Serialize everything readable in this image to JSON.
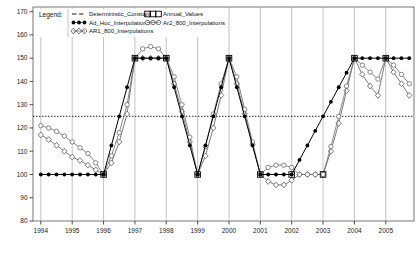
{
  "chart_data": {
    "type": "line",
    "title": "",
    "xlabel": "",
    "ylabel": "",
    "xlim": [
      1993.75,
      2005.9
    ],
    "ylim": [
      80,
      172
    ],
    "grid": true,
    "y_ticks": [
      80,
      90,
      100,
      110,
      120,
      130,
      140,
      150,
      160,
      170
    ],
    "x_ticks": [
      1994,
      1995,
      1996,
      1997,
      1998,
      1999,
      2000,
      2001,
      2002,
      2003,
      2004,
      2005
    ],
    "reference_line": {
      "name": "Deterministic_Constant",
      "value": 125,
      "style": "dotted"
    },
    "legend": {
      "position": "top-left-inside",
      "title": "Legend:",
      "entries": [
        {
          "label": "Deterministic_Constant",
          "marker": "none",
          "line": "dashed",
          "color": "#000000"
        },
        {
          "label": "Ad_Hoc_Interpolations",
          "marker": "filled-circle",
          "line": "solid",
          "color": "#000000"
        },
        {
          "label": "AR1_800_Interpolations",
          "marker": "open-diamond",
          "line": "solid",
          "color": "#4d4d4d"
        },
        {
          "label": "Annual_Values",
          "marker": "open-square",
          "line": "none",
          "color": "#000000"
        },
        {
          "label": "Ar2_800_Interpolations",
          "marker": "open-circle",
          "line": "solid",
          "color": "#4d4d4d"
        }
      ]
    },
    "series": [
      {
        "name": "Ad_Hoc_Interpolations",
        "marker": "filled-circle",
        "x": [
          1994.0,
          1994.25,
          1994.5,
          1994.75,
          1995.0,
          1995.25,
          1995.5,
          1995.75,
          1996.0,
          1996.25,
          1996.5,
          1996.75,
          1997.0,
          1997.25,
          1997.5,
          1997.75,
          1998.0,
          1998.25,
          1998.5,
          1998.75,
          1999.0,
          1999.25,
          1999.5,
          1999.75,
          2000.0,
          2000.25,
          2000.5,
          2000.75,
          2001.0,
          2001.25,
          2001.5,
          2001.75,
          2002.0,
          2002.25,
          2002.5,
          2002.75,
          2003.0,
          2003.25,
          2003.5,
          2003.75,
          2004.0,
          2004.25,
          2004.5,
          2004.75,
          2005.0,
          2005.25,
          2005.5,
          2005.75
        ],
        "y": [
          100,
          100,
          100,
          100,
          100,
          100,
          100,
          100,
          100,
          112.5,
          125,
          137.5,
          150,
          150,
          150,
          150,
          150,
          137.5,
          125,
          112.5,
          100,
          112.5,
          125,
          137.5,
          150,
          137.5,
          125,
          112.5,
          100,
          100,
          100,
          100,
          100,
          106.25,
          112.5,
          118.75,
          125,
          131.25,
          137.5,
          143.75,
          150,
          150,
          150,
          150,
          150,
          150,
          150,
          150
        ]
      },
      {
        "name": "AR1_800_Interpolations",
        "marker": "open-diamond",
        "x": [
          1994.0,
          1994.25,
          1994.5,
          1994.75,
          1995.0,
          1995.25,
          1995.5,
          1995.75,
          1996.0,
          1996.25,
          1996.5,
          1996.75,
          1997.0,
          1997.25,
          1997.5,
          1997.75,
          1998.0,
          1998.25,
          1998.5,
          1998.75,
          1999.0,
          1999.25,
          1999.5,
          1999.75,
          2000.0,
          2000.25,
          2000.5,
          2000.75,
          2001.0,
          2001.25,
          2001.5,
          2001.75,
          2002.0,
          2002.25,
          2002.5,
          2002.75,
          2003.0,
          2003.25,
          2003.5,
          2003.75,
          2004.0,
          2004.25,
          2004.5,
          2004.75,
          2005.0,
          2005.25,
          2005.5,
          2005.75
        ],
        "y": [
          117,
          115,
          112.5,
          110,
          107.5,
          106,
          104,
          102,
          100,
          105,
          114,
          126,
          150,
          150,
          150,
          150,
          150,
          139,
          127,
          114,
          100,
          108,
          120,
          134,
          150,
          139,
          126,
          113,
          100,
          97,
          95.5,
          95.5,
          97.5,
          100,
          100,
          100,
          100,
          110,
          122,
          136,
          150,
          143,
          138,
          134,
          150,
          144,
          139,
          134
        ]
      },
      {
        "name": "Ar2_800_Interpolations",
        "marker": "open-circle",
        "x": [
          1994.0,
          1994.25,
          1994.5,
          1994.75,
          1995.0,
          1995.25,
          1995.5,
          1995.75,
          1996.0,
          1996.25,
          1996.5,
          1996.75,
          1997.0,
          1997.25,
          1997.5,
          1997.75,
          1998.0,
          1998.25,
          1998.5,
          1998.75,
          1999.0,
          1999.25,
          1999.5,
          1999.75,
          2000.0,
          2000.25,
          2000.5,
          2000.75,
          2001.0,
          2001.25,
          2001.5,
          2001.75,
          2002.0,
          2002.25,
          2002.5,
          2002.75,
          2003.0,
          2003.25,
          2003.5,
          2003.75,
          2004.0,
          2004.25,
          2004.5,
          2004.75,
          2005.0,
          2005.25,
          2005.5,
          2005.75
        ],
        "y": [
          121,
          120,
          118.5,
          116.5,
          114,
          111.5,
          109,
          105,
          100,
          108,
          118,
          130,
          150,
          154,
          155,
          154,
          150,
          142,
          130,
          116,
          100,
          112,
          126,
          139,
          150,
          142,
          128,
          114,
          100,
          103,
          104,
          104,
          103,
          100,
          100,
          100,
          100,
          112,
          125,
          138,
          150,
          147,
          144,
          141,
          150,
          147,
          143,
          139
        ]
      },
      {
        "name": "Annual_Values",
        "marker": "open-square",
        "line": "none",
        "x": [
          1996.0,
          1997.0,
          1998.0,
          1999.0,
          2000.0,
          2001.0,
          2002.0,
          2003.0,
          2004.0,
          2005.0
        ],
        "y": [
          100,
          150,
          150,
          100,
          150,
          100,
          100,
          100,
          150,
          150
        ]
      }
    ]
  },
  "axes": {
    "y_tick_labels": [
      "170",
      "160",
      "150",
      "140",
      "130",
      "120",
      "110",
      "100",
      "90",
      "80"
    ],
    "x_tick_labels": [
      "1994",
      "1995",
      "1996",
      "1997",
      "1998",
      "1999",
      "2000",
      "2001",
      "2002",
      "2003",
      "2004",
      "2005"
    ]
  },
  "legend": {
    "title": "Legend:",
    "col1": [
      "Deterministic_Constant",
      "Ad_Hoc_Interpolations",
      "AR1_800_Interpolations"
    ],
    "col2": [
      "Annual_Values",
      "Ar2_800_Interpolations"
    ]
  }
}
